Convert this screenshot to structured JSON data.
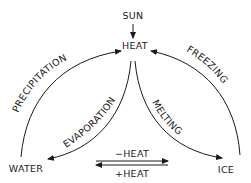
{
  "diagram": {
    "nodes": {
      "sun": "SUN",
      "heat": "HEAT",
      "water": "WATER",
      "ice": "ICE"
    },
    "edges": {
      "precipitation": "PRECIPITATION",
      "evaporation": "EVAPORATION",
      "freezing": "FREEZING",
      "melting": "MELTING",
      "minus_heat": "−HEAT",
      "plus_heat": "+HEAT"
    },
    "colors": {
      "ink": "#1a1a1a",
      "background": "#ffffff"
    }
  }
}
